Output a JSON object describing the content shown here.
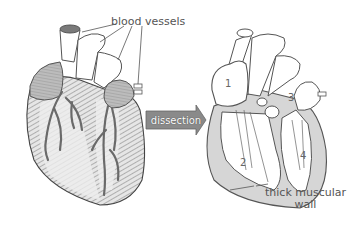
{
  "diagram": {
    "labels": {
      "blood_vessels": "blood vessels",
      "thick_wall_line1": "thick muscular",
      "thick_wall_line2": "wall"
    },
    "arrow_label": "dissection",
    "chambers": {
      "c1": "1",
      "c2": "2",
      "c3": "3",
      "c4": "4"
    },
    "colors": {
      "outline": "#555555",
      "muscle_fill": "#d8d8d8",
      "atria_fill": "#bdbdbd",
      "vessel_dark": "#6e6e6e",
      "arrow_fill": "#8a8a8a",
      "wall_fill": "#d6d6d6"
    }
  }
}
